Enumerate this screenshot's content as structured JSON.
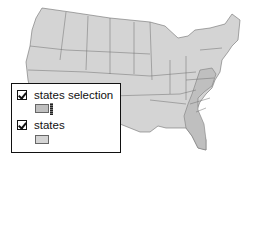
{
  "map": {
    "title": "",
    "base_fill": "#d4d4d4",
    "selected_fill": "#bfbfbf",
    "border_color": "#6e6e6e",
    "selected_states": [
      "West Virginia",
      "Virginia",
      "North Carolina",
      "South Carolina",
      "Georgia",
      "Florida"
    ]
  },
  "legend": {
    "layers": [
      {
        "label": "states selection",
        "checked": true,
        "swatch_color": "#bfbfbf"
      },
      {
        "label": "states",
        "checked": true,
        "swatch_color": "#d4d4d4"
      }
    ]
  }
}
